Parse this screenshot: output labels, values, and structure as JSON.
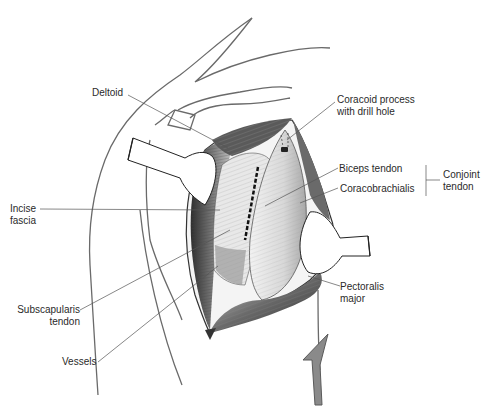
{
  "figure": {
    "labels": {
      "deltoid": "Deltoid",
      "coracoid_line1": "Coracoid process",
      "coracoid_line2": "with drill hole",
      "biceps_tendon": "Biceps tendon",
      "coracobrachialis": "Coracobrachialis",
      "conjoint_line1": "Conjoint",
      "conjoint_line2": "tendon",
      "incise_line1": "Incise",
      "incise_line2": "fascia",
      "subscap_line1": "Subscapularis",
      "subscap_line2": "tendon",
      "vessels": "Vessels",
      "pectoralis_line1": "Pectoralis",
      "pectoralis_line2": "major"
    },
    "colors": {
      "ink": "#2a2a2a",
      "line": "#555555",
      "muscle_dark": "#3a3a3a",
      "muscle_mid": "#8a8a8a",
      "tissue_light": "#e4e4e4",
      "retractor": "#ffffff"
    }
  }
}
